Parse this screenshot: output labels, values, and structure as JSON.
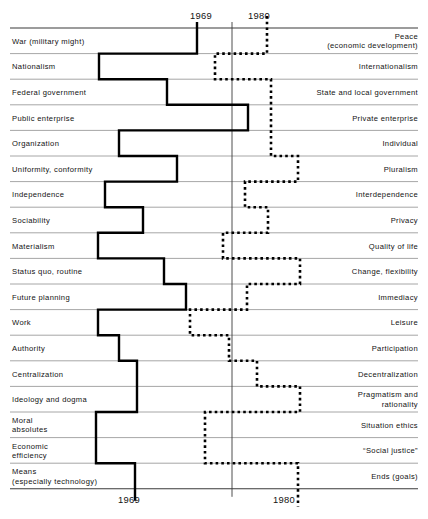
{
  "chart_data": {
    "type": "line",
    "title": "",
    "subtitle": "",
    "xlabel": "",
    "ylabel": "",
    "grid": true,
    "legend_position": "none",
    "axis_top_ticks": [
      "1969",
      "1980"
    ],
    "axis_bottom_ticks": [
      "1969",
      "1980"
    ],
    "x_axis_meaning": "position between the left pole and the right pole of each value pair",
    "series": [
      {
        "name": "1969",
        "style": "solid",
        "color": "#000000",
        "values": [
          197,
          99,
          167,
          248,
          119,
          177,
          105,
          143,
          98,
          164,
          186,
          98,
          119,
          137,
          137,
          96,
          96,
          135
        ]
      },
      {
        "name": "1980",
        "style": "dotted",
        "color": "#000000",
        "values": [
          267,
          215,
          271,
          271,
          271,
          298,
          245,
          268,
          223,
          300,
          247,
          190,
          229,
          257,
          300,
          205,
          205,
          298
        ]
      }
    ],
    "categories": [
      "War (military might) / Peace (economic development)",
      "Nationalism / Internationalism",
      "Federal government / State and local government",
      "Public enterprise / Private enterprise",
      "Organization / Individual",
      "Uniformity, conformity / Pluralism",
      "Independence / Interdependence",
      "Sociability / Privacy",
      "Materialism / Quality of life",
      "Status quo, routine / Change, flexibility",
      "Future planning / Immediacy",
      "Work / Leisure",
      "Authority / Participation",
      "Centralization / Decentralization",
      "Ideology and dogma / Pragmatism and rationality",
      "Moral absolutes / Situation ethics",
      "Economic efficiency / \"Social justice\"",
      "Means (especially technology) / Ends (goals)"
    ]
  },
  "axis": {
    "top": {
      "left_tick": "1969",
      "right_tick": "1980"
    },
    "bottom": {
      "left_tick": "1969",
      "right_tick": "1980"
    }
  },
  "rows": [
    {
      "left": "War (military might)",
      "right": "Peace\n(economic development)",
      "solid": 197,
      "dotted": 267
    },
    {
      "left": "Nationalism",
      "right": "Internationalism",
      "solid": 99,
      "dotted": 215
    },
    {
      "left": "Federal government",
      "right": "State and local government",
      "solid": 167,
      "dotted": 271
    },
    {
      "left": "Public enterprise",
      "right": "Private enterprise",
      "solid": 248,
      "dotted": 271
    },
    {
      "left": "Organization",
      "right": "Individual",
      "solid": 119,
      "dotted": 271
    },
    {
      "left": "Uniformity, conformity",
      "right": "Pluralism",
      "solid": 177,
      "dotted": 298
    },
    {
      "left": "Independence",
      "right": "Interdependence",
      "solid": 105,
      "dotted": 245
    },
    {
      "left": "Sociability",
      "right": "Privacy",
      "solid": 143,
      "dotted": 268
    },
    {
      "left": "Materialism",
      "right": "Quality of life",
      "solid": 98,
      "dotted": 223
    },
    {
      "left": "Status quo, routine",
      "right": "Change, flexibility",
      "solid": 164,
      "dotted": 300
    },
    {
      "left": "Future planning",
      "right": "Immediacy",
      "solid": 186,
      "dotted": 247
    },
    {
      "left": "Work",
      "right": "Leisure",
      "solid": 98,
      "dotted": 190
    },
    {
      "left": "Authority",
      "right": "Participation",
      "solid": 119,
      "dotted": 229
    },
    {
      "left": "Centralization",
      "right": "Decentralization",
      "solid": 137,
      "dotted": 257
    },
    {
      "left": "Ideology and dogma",
      "right": "Pragmatism and\nrationality",
      "solid": 137,
      "dotted": 300
    },
    {
      "left": "Moral\nabsolutes",
      "right": "Situation ethics",
      "solid": 96,
      "dotted": 205
    },
    {
      "left": "Economic\nefficiency",
      "right": "“Social justice”",
      "solid": 96,
      "dotted": 205
    },
    {
      "left": "Means\n(especially technology)",
      "right": "Ends (goals)",
      "solid": 135,
      "dotted": 298
    }
  ],
  "colors": {
    "line": "#000000",
    "rule": "#8f8f8f",
    "axis": "#3a3a3a",
    "text": "#121212",
    "background": "#ffffff"
  }
}
